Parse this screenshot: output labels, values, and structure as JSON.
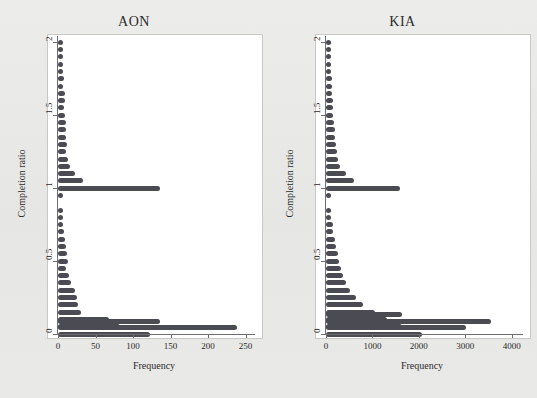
{
  "figure": {
    "background_color": "#e9e9e7",
    "bar_color": "#4b4b53",
    "plot_background": "#ffffff"
  },
  "panels": [
    {
      "key": "aon",
      "title": "AON"
    },
    {
      "key": "kia",
      "title": "KIA"
    }
  ],
  "chart_data": [
    {
      "type": "bar",
      "orientation": "horizontal",
      "title": "AON",
      "xlabel": "Frequency",
      "ylabel": "Completion ratio",
      "xlim": [
        0,
        260
      ],
      "ylim": [
        0,
        2.03
      ],
      "xticks": [
        0,
        50,
        100,
        150,
        200,
        250
      ],
      "xticklabels": [
        "0",
        "50",
        "100",
        "150",
        "200",
        "250"
      ],
      "yticks": [
        0,
        0.5,
        1,
        1.5,
        2
      ],
      "yticklabels": [
        "0",
        "0.5",
        "1",
        "1.5",
        "2"
      ],
      "grid": false,
      "legend": false,
      "categories": [
        2.0,
        1.95,
        1.9,
        1.85,
        1.8,
        1.75,
        1.7,
        1.65,
        1.6,
        1.55,
        1.5,
        1.45,
        1.4,
        1.35,
        1.3,
        1.25,
        1.2,
        1.15,
        1.1,
        1.05,
        1.0,
        0.95,
        0.9,
        0.85,
        0.8,
        0.75,
        0.7,
        0.65,
        0.6,
        0.55,
        0.5,
        0.45,
        0.4,
        0.35,
        0.3,
        0.25,
        0.2,
        0.15,
        0.1,
        0.05,
        0.0
      ],
      "values": [
        4,
        6,
        6,
        6,
        7,
        8,
        6,
        9,
        9,
        8,
        9,
        11,
        10,
        11,
        12,
        11,
        13,
        16,
        22,
        33,
        136,
        4,
        0,
        6,
        7,
        6,
        8,
        9,
        11,
        12,
        13,
        11,
        14,
        17,
        22,
        25,
        26,
        30,
        68,
        82,
        122
      ],
      "extra_bars_bottom": [
        239,
        136
      ],
      "notes": "Two tallest bottom bars at completion ratio just above 0 reach 239 and 136; the spike at ratio 1 reaches 136."
    },
    {
      "type": "bar",
      "orientation": "horizontal",
      "title": "KIA",
      "xlabel": "Frequency",
      "ylabel": "Completion ratio",
      "xlim": [
        0,
        4200
      ],
      "ylim": [
        0,
        2.03
      ],
      "xticks": [
        0,
        1000,
        2000,
        3000,
        4000
      ],
      "xticklabels": [
        "0",
        "1000",
        "2000",
        "3000",
        "4000"
      ],
      "yticks": [
        0,
        0.5,
        1,
        1.5,
        2
      ],
      "yticklabels": [
        "0",
        "0.5",
        "1",
        "1.5",
        "2"
      ],
      "grid": false,
      "legend": false,
      "categories": [
        2.0,
        1.95,
        1.9,
        1.85,
        1.8,
        1.75,
        1.7,
        1.65,
        1.6,
        1.55,
        1.5,
        1.45,
        1.4,
        1.35,
        1.3,
        1.25,
        1.2,
        1.15,
        1.1,
        1.05,
        1.0,
        0.95,
        0.9,
        0.85,
        0.8,
        0.75,
        0.7,
        0.65,
        0.6,
        0.55,
        0.5,
        0.45,
        0.4,
        0.35,
        0.3,
        0.25,
        0.2,
        0.15,
        0.1,
        0.05,
        0.0
      ],
      "values": [
        70,
        90,
        95,
        100,
        110,
        120,
        125,
        135,
        140,
        150,
        160,
        170,
        185,
        200,
        215,
        230,
        250,
        300,
        430,
        600,
        1600,
        60,
        0,
        90,
        110,
        140,
        160,
        190,
        220,
        250,
        280,
        320,
        360,
        430,
        520,
        640,
        800,
        1060,
        1310,
        1640,
        2060
      ],
      "extra_bars_bottom": [
        3020,
        3550,
        1640
      ],
      "notes": "Spike at completion ratio 1 reaches about 1600; bottom cluster peaks near 3550."
    }
  ],
  "axes": {
    "x_title": "Frequency",
    "y_title": "Completion ratio",
    "aon": {
      "xticklabels": [
        "0",
        "50",
        "100",
        "150",
        "200",
        "250"
      ],
      "yticklabels": [
        "2",
        "1.5",
        "1",
        "0.5",
        "0"
      ]
    },
    "kia": {
      "xticklabels": [
        "0",
        "1000",
        "2000",
        "3000",
        "4000"
      ],
      "yticklabels": [
        "2",
        "1.5",
        "1",
        "0.5",
        "0"
      ]
    }
  }
}
